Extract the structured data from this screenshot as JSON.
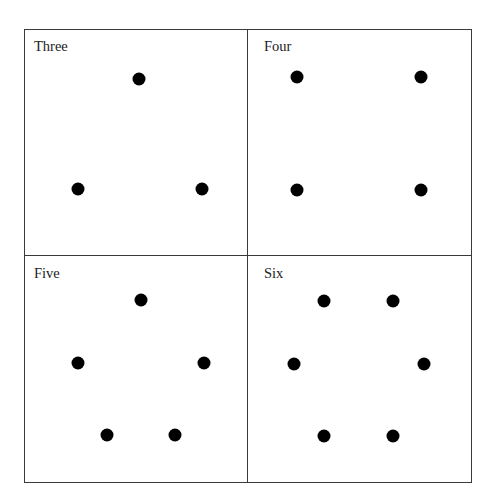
{
  "panels": [
    {
      "label": "Three",
      "count": 3,
      "label_pos": [
        34,
        39
      ],
      "dots": [
        [
          139,
          79
        ],
        [
          78,
          189
        ],
        [
          202,
          189
        ]
      ]
    },
    {
      "label": "Four",
      "count": 4,
      "label_pos": [
        264,
        39
      ],
      "dots": [
        [
          297,
          77
        ],
        [
          421,
          77
        ],
        [
          297,
          190
        ],
        [
          421,
          190
        ]
      ]
    },
    {
      "label": "Five",
      "count": 5,
      "label_pos": [
        34,
        266
      ],
      "dots": [
        [
          141,
          300
        ],
        [
          78,
          363
        ],
        [
          204,
          363
        ],
        [
          107,
          435
        ],
        [
          175,
          435
        ]
      ]
    },
    {
      "label": "Six",
      "count": 6,
      "label_pos": [
        264,
        266
      ],
      "dots": [
        [
          324,
          301
        ],
        [
          393,
          301
        ],
        [
          294,
          364
        ],
        [
          424,
          364
        ],
        [
          324,
          436
        ],
        [
          393,
          436
        ]
      ]
    }
  ],
  "colors": {
    "border": "#3a3a3a",
    "dot": "#000000",
    "text": "#222222"
  }
}
